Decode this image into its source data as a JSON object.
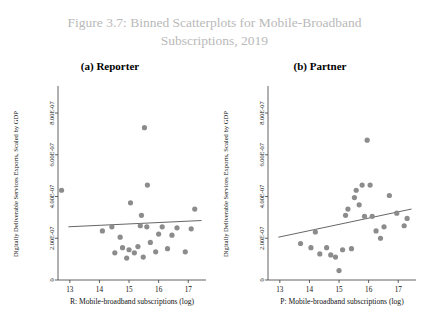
{
  "figure": {
    "title_line1": "Figure 3.7: Binned Scatterplots for Mobile-Broadband",
    "title_line2": "Subscriptions, 2019",
    "title_color": "#b9b9b9"
  },
  "panels": [
    {
      "key": "reporter",
      "label": "(a) Reporter"
    },
    {
      "key": "partner",
      "label": "(b) Partner"
    }
  ],
  "chart_data": [
    {
      "type": "scatter",
      "title": "(a) Reporter",
      "xlabel": "R: Mobile-broadband subscriptions (log)",
      "ylabel": "Digitally Deliverable Services Exports, Scaled by GDP",
      "xlim": [
        12.6,
        17.6
      ],
      "ylim": [
        0,
        9.2e-07
      ],
      "xticks": [
        13,
        14,
        15,
        16,
        17
      ],
      "xtick_labels": [
        "13",
        "14",
        "15",
        "16",
        "17"
      ],
      "yticks": [
        0,
        2e-07,
        4e-07,
        6e-07,
        8e-07
      ],
      "ytick_labels": [
        "0",
        "2.00E-07",
        "4.00E-07",
        "6.00E-07",
        "8.00E-07"
      ],
      "grid": false,
      "legend": "none",
      "marker_color": "#8c8c8c",
      "line_color": "#555555",
      "points": [
        {
          "x": 12.72,
          "y": 4.3e-07
        },
        {
          "x": 14.1,
          "y": 2.35e-07
        },
        {
          "x": 14.42,
          "y": 2.55e-07
        },
        {
          "x": 14.52,
          "y": 1.3e-07
        },
        {
          "x": 14.7,
          "y": 2.05e-07
        },
        {
          "x": 14.78,
          "y": 1.55e-07
        },
        {
          "x": 14.92,
          "y": 1.05e-07
        },
        {
          "x": 15.0,
          "y": 1.45e-07
        },
        {
          "x": 15.05,
          "y": 3.7e-07
        },
        {
          "x": 15.18,
          "y": 1.3e-07
        },
        {
          "x": 15.3,
          "y": 1.6e-07
        },
        {
          "x": 15.38,
          "y": 2.6e-07
        },
        {
          "x": 15.42,
          "y": 3.1e-07
        },
        {
          "x": 15.48,
          "y": 1.1e-07
        },
        {
          "x": 15.52,
          "y": 7.3e-07
        },
        {
          "x": 15.6,
          "y": 2.55e-07
        },
        {
          "x": 15.62,
          "y": 4.55e-07
        },
        {
          "x": 15.72,
          "y": 1.8e-07
        },
        {
          "x": 15.9,
          "y": 1.35e-07
        },
        {
          "x": 16.0,
          "y": 2.2e-07
        },
        {
          "x": 16.12,
          "y": 2.55e-07
        },
        {
          "x": 16.3,
          "y": 1.5e-07
        },
        {
          "x": 16.45,
          "y": 2.15e-07
        },
        {
          "x": 16.62,
          "y": 2.5e-07
        },
        {
          "x": 16.9,
          "y": 1.35e-07
        },
        {
          "x": 17.1,
          "y": 2.45e-07
        },
        {
          "x": 17.22,
          "y": 3.4e-07
        }
      ],
      "fit_line": {
        "x0": 12.95,
        "y0": 2.55e-07,
        "x1": 17.45,
        "y1": 2.85e-07
      }
    },
    {
      "type": "scatter",
      "title": "(b) Partner",
      "xlabel": "P: Mobile-broadband subscriptions (log)",
      "ylabel": "Digitally Deliverable Services Exports, Scaled by GDP",
      "xlim": [
        12.6,
        17.6
      ],
      "ylim": [
        0,
        9.2e-07
      ],
      "xticks": [
        13,
        14,
        15,
        16,
        17
      ],
      "xtick_labels": [
        "13",
        "14",
        "15",
        "16",
        "17"
      ],
      "yticks": [
        0,
        2e-07,
        4e-07,
        6e-07,
        8e-07
      ],
      "ytick_labels": [
        "0",
        "2.00E-07",
        "4.00E-07",
        "6.00E-07",
        "8.00E-07"
      ],
      "grid": false,
      "legend": "none",
      "marker_color": "#8c8c8c",
      "line_color": "#555555",
      "points": [
        {
          "x": 13.7,
          "y": 1.75e-07
        },
        {
          "x": 14.05,
          "y": 1.55e-07
        },
        {
          "x": 14.2,
          "y": 2.3e-07
        },
        {
          "x": 14.35,
          "y": 1.25e-07
        },
        {
          "x": 14.58,
          "y": 1.55e-07
        },
        {
          "x": 14.72,
          "y": 1.2e-07
        },
        {
          "x": 14.88,
          "y": 1.1e-07
        },
        {
          "x": 15.0,
          "y": 4.5e-08
        },
        {
          "x": 15.12,
          "y": 1.45e-07
        },
        {
          "x": 15.22,
          "y": 3.1e-07
        },
        {
          "x": 15.3,
          "y": 3.4e-07
        },
        {
          "x": 15.42,
          "y": 1.5e-07
        },
        {
          "x": 15.52,
          "y": 3.95e-07
        },
        {
          "x": 15.58,
          "y": 4.3e-07
        },
        {
          "x": 15.68,
          "y": 3.6e-07
        },
        {
          "x": 15.78,
          "y": 4.55e-07
        },
        {
          "x": 15.86,
          "y": 3.05e-07
        },
        {
          "x": 15.95,
          "y": 6.7e-07
        },
        {
          "x": 16.05,
          "y": 4.55e-07
        },
        {
          "x": 16.12,
          "y": 3.05e-07
        },
        {
          "x": 16.25,
          "y": 2.35e-07
        },
        {
          "x": 16.4,
          "y": 2e-07
        },
        {
          "x": 16.52,
          "y": 2.55e-07
        },
        {
          "x": 16.7,
          "y": 4.05e-07
        },
        {
          "x": 16.95,
          "y": 3.2e-07
        },
        {
          "x": 17.2,
          "y": 2.6e-07
        },
        {
          "x": 17.3,
          "y": 2.95e-07
        }
      ],
      "fit_line": {
        "x0": 12.95,
        "y0": 2.05e-07,
        "x1": 17.45,
        "y1": 3.4e-07
      }
    }
  ]
}
